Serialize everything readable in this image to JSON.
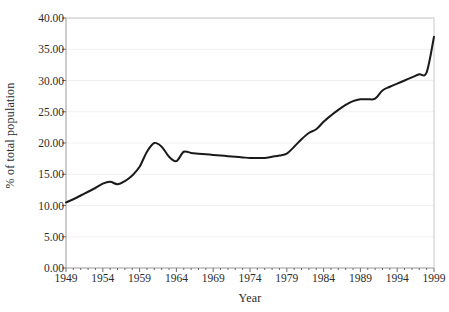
{
  "chart_data": {
    "type": "line",
    "title": "",
    "xlabel": "Year",
    "ylabel": "% of total population",
    "xlim": [
      1949,
      1999
    ],
    "ylim": [
      0,
      40
    ],
    "grid": true,
    "legend": false,
    "y_tick_labels": [
      "40.00",
      "35.00",
      "30.00",
      "25.00",
      "20.00",
      "15.00",
      "10.00",
      "5.00",
      "0.00"
    ],
    "y_tick_values": [
      40,
      35,
      30,
      25,
      20,
      15,
      10,
      5,
      0
    ],
    "x_tick_labels": [
      "1949",
      "1954",
      "1959",
      "1964",
      "1969",
      "1974",
      "1979",
      "1984",
      "1989",
      "1994",
      "1999"
    ],
    "x_tick_values": [
      1949,
      1954,
      1959,
      1964,
      1969,
      1974,
      1979,
      1984,
      1989,
      1994,
      1999
    ],
    "series": [
      {
        "name": "% of total population",
        "color": "#1a1a1a",
        "x": [
          1949,
          1950,
          1951,
          1952,
          1953,
          1954,
          1955,
          1956,
          1957,
          1958,
          1959,
          1960,
          1961,
          1962,
          1963,
          1964,
          1965,
          1966,
          1967,
          1968,
          1969,
          1970,
          1971,
          1972,
          1973,
          1974,
          1975,
          1976,
          1977,
          1978,
          1979,
          1980,
          1981,
          1982,
          1983,
          1984,
          1985,
          1986,
          1987,
          1988,
          1989,
          1990,
          1991,
          1992,
          1993,
          1994,
          1995,
          1996,
          1997,
          1998,
          1999
        ],
        "values": [
          10.5,
          11.0,
          11.6,
          12.2,
          12.8,
          13.5,
          13.8,
          13.4,
          13.9,
          14.8,
          16.2,
          18.6,
          20.0,
          19.4,
          17.8,
          17.1,
          18.6,
          18.4,
          18.3,
          18.2,
          18.1,
          18.0,
          17.9,
          17.8,
          17.7,
          17.6,
          17.6,
          17.6,
          17.8,
          18.0,
          18.3,
          19.4,
          20.6,
          21.6,
          22.2,
          23.4,
          24.4,
          25.3,
          26.1,
          26.7,
          27.0,
          27.0,
          27.1,
          28.4,
          29.0,
          29.5,
          30.0,
          30.5,
          31.0,
          31.3,
          37.0
        ]
      }
    ]
  },
  "axes": {
    "x_title": "Year",
    "y_title": "% of total population"
  }
}
